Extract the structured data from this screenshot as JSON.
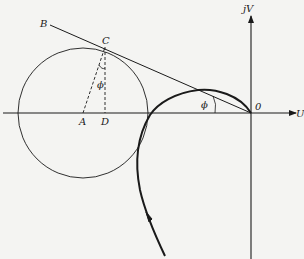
{
  "diagram": {
    "type": "nyquist-locus-with-circle",
    "axes": {
      "horizontal_label": "U",
      "vertical_label": "jV",
      "origin_label": "0"
    },
    "points": {
      "A": "A",
      "B": "B",
      "C": "C",
      "D": "D"
    },
    "angle_labels": {
      "phi_in_circle": "ϕ",
      "phi_at_locus": "ϕ"
    },
    "colors": {
      "background": "#f4f4f2",
      "ink": "#1a1a1a"
    }
  }
}
